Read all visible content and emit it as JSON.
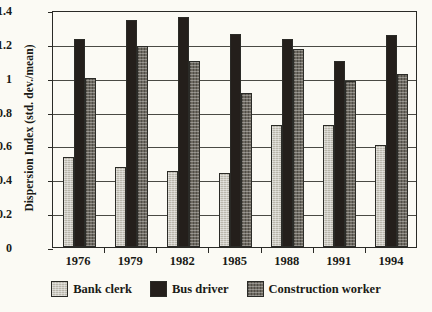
{
  "chart_data": {
    "type": "bar",
    "title": "",
    "xlabel": "",
    "ylabel": "Dispersion Index (std. dev./mean)",
    "categories": [
      "1976",
      "1979",
      "1982",
      "1985",
      "1988",
      "1991",
      "1994"
    ],
    "series": [
      {
        "name": "Bank clerk",
        "color": "#b9b6ab",
        "values": [
          0.53,
          0.47,
          0.45,
          0.44,
          0.72,
          0.72,
          0.6
        ]
      },
      {
        "name": "Bus driver",
        "color": "#241f1b",
        "values": [
          1.23,
          1.34,
          1.36,
          1.26,
          1.23,
          1.1,
          1.25
        ]
      },
      {
        "name": "Construction worker",
        "color": "#6e6a61",
        "values": [
          1.0,
          1.19,
          1.1,
          0.91,
          1.17,
          0.98,
          1.02
        ]
      }
    ],
    "ylim": [
      0,
      1.4
    ],
    "yticks": [
      "0",
      "0.2",
      "0.4",
      "0.6",
      "0.8",
      "1",
      "1.2",
      "1.4"
    ],
    "ytick_values": [
      0,
      0.2,
      0.4,
      0.6,
      0.8,
      1.0,
      1.2,
      1.4
    ],
    "grid": true,
    "grid_axis": "y",
    "legend_position": "bottom"
  }
}
